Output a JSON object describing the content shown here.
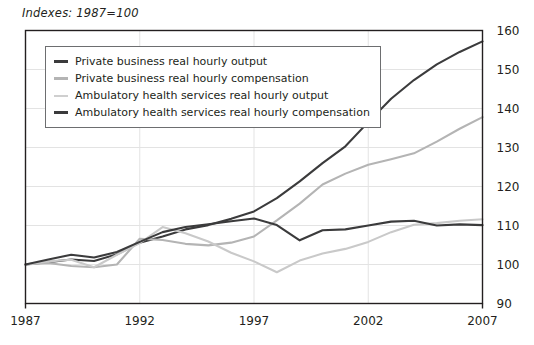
{
  "chart_data": {
    "type": "line",
    "title": "Indexes: 1987=100",
    "xlabel": "",
    "ylabel": "",
    "xlim": [
      1987,
      2007
    ],
    "ylim": [
      90,
      160
    ],
    "ytick_step": 10,
    "yticks": [
      90,
      100,
      110,
      120,
      130,
      140,
      150,
      160
    ],
    "xticks": [
      1987,
      1992,
      1997,
      2002,
      2007
    ],
    "grid": true,
    "grid_axis": "both",
    "legend_position": "upper-left-inside",
    "x": [
      1987,
      1988,
      1989,
      1990,
      1991,
      1992,
      1993,
      1994,
      1995,
      1996,
      1997,
      1998,
      1999,
      2000,
      2001,
      2002,
      2003,
      2004,
      2005,
      2006,
      2007
    ],
    "series": [
      {
        "name": "Private business real hourly output",
        "color": "#3b3b3c",
        "width": 2.1,
        "values": [
          100.0,
          100.6,
          101.3,
          100.9,
          102.6,
          105.6,
          107.2,
          109.0,
          110.1,
          111.7,
          113.6,
          117.0,
          121.3,
          126.0,
          130.3,
          136.5,
          142.5,
          147.3,
          151.3,
          154.5,
          157.2
        ]
      },
      {
        "name": "Private business real hourly compensation",
        "color": "#b4b4b4",
        "width": 2.1,
        "values": [
          100.0,
          100.4,
          99.6,
          99.3,
          100.0,
          106.6,
          106.3,
          105.3,
          104.9,
          105.6,
          107.2,
          111.3,
          115.6,
          120.5,
          123.3,
          125.6,
          127.0,
          128.5,
          131.5,
          134.8,
          137.8
        ]
      },
      {
        "name": "Ambulatory health services real hourly output",
        "color": "#c9c9c9",
        "width": 2.1,
        "values": [
          100.0,
          100.8,
          101.2,
          99.3,
          102.5,
          105.5,
          109.6,
          108.0,
          105.9,
          103.0,
          100.8,
          98.0,
          101.0,
          102.8,
          104.0,
          105.8,
          108.3,
          110.2,
          110.6,
          111.2,
          111.6
        ]
      },
      {
        "name": "Ambulatory health services real hourly compensation",
        "color": "#3b3b3c",
        "width": 2.1,
        "values": [
          100.0,
          101.3,
          102.5,
          101.8,
          103.2,
          105.8,
          108.3,
          109.6,
          110.3,
          111.1,
          111.8,
          110.1,
          106.2,
          108.8,
          109.0,
          110.0,
          111.0,
          111.2,
          110.0,
          110.3,
          110.1
        ]
      }
    ]
  },
  "legend": {
    "items": [
      {
        "label": "Private business real hourly output",
        "color": "#3b3b3c",
        "width": 3
      },
      {
        "label": "Private business real hourly compensation",
        "color": "#b4b4b4",
        "width": 3
      },
      {
        "label": "Ambulatory health services real hourly output",
        "color": "#cfcfcf",
        "width": 2
      },
      {
        "label": "Ambulatory health services real hourly compensation",
        "color": "#3b3b3c",
        "width": 3
      }
    ]
  },
  "axis": {
    "y_tick_labels": [
      "160",
      "150",
      "140",
      "130",
      "120",
      "110",
      "100",
      "90"
    ],
    "x_tick_labels": [
      "1987",
      "1992",
      "1997",
      "2002",
      "2007"
    ]
  },
  "colors": {
    "frame": "#231f20",
    "grid": "#e3e3e3",
    "text": "#231f20",
    "background": "#ffffff"
  }
}
